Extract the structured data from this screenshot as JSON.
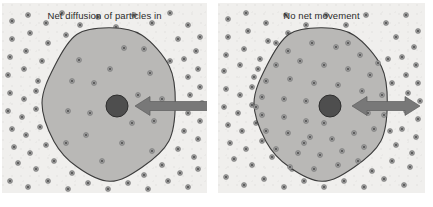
{
  "figure": {
    "kind": "science-diagram",
    "topic": "diffusion across a cell membrane",
    "background_color": "#ffffff",
    "panel_background": "#f0efed"
  },
  "style": {
    "cell_fill": "#b9b8b6",
    "cell_stroke": "#3c3c3c",
    "nucleus_fill": "#4e4e4e",
    "nucleus_stroke": "#2e2e2e",
    "arrow_fill": "#787878",
    "arrow_stroke": "#5d5d5d",
    "particle_fill": "#9a9a9a",
    "particle_core": "#4a4a4a",
    "label_color": "#2b2b2b"
  },
  "panels": [
    {
      "id": "left",
      "label": "Net diffusion of particles in",
      "arrow_icon": "arrow-left-icon",
      "arrow_direction": "inward",
      "arrow_heads": 1,
      "inside_density": "sparse",
      "outside_density": "dense",
      "cell": {
        "cx": 108,
        "cy": 100,
        "rx": 66,
        "ry": 76
      },
      "nucleus": {
        "cx": 115,
        "cy": 103,
        "r": 11
      },
      "arrow": {
        "x1": 208,
        "y1": 103,
        "x2": 133,
        "y2": 103,
        "thickness": 9
      },
      "particles_inside": [
        [
          77,
          57
        ],
        [
          122,
          45
        ],
        [
          148,
          70
        ],
        [
          92,
          80
        ],
        [
          136,
          92
        ],
        [
          66,
          108
        ],
        [
          152,
          118
        ],
        [
          84,
          132
        ],
        [
          120,
          140
        ],
        [
          100,
          158
        ],
        [
          142,
          46
        ],
        [
          70,
          78
        ],
        [
          160,
          96
        ],
        [
          108,
          66
        ],
        [
          130,
          120
        ],
        [
          88,
          110
        ],
        [
          150,
          148
        ],
        [
          64,
          140
        ]
      ],
      "particles_outside": [
        [
          10,
          18
        ],
        [
          26,
          12
        ],
        [
          44,
          20
        ],
        [
          60,
          10
        ],
        [
          78,
          22
        ],
        [
          96,
          14
        ],
        [
          114,
          24
        ],
        [
          132,
          12
        ],
        [
          150,
          20
        ],
        [
          168,
          10
        ],
        [
          186,
          22
        ],
        [
          198,
          34
        ],
        [
          10,
          36
        ],
        [
          28,
          30
        ],
        [
          46,
          40
        ],
        [
          64,
          32
        ],
        [
          176,
          36
        ],
        [
          194,
          48
        ],
        [
          8,
          54
        ],
        [
          24,
          48
        ],
        [
          40,
          58
        ],
        [
          182,
          56
        ],
        [
          196,
          66
        ],
        [
          6,
          72
        ],
        [
          22,
          66
        ],
        [
          36,
          78
        ],
        [
          186,
          74
        ],
        [
          198,
          84
        ],
        [
          8,
          90
        ],
        [
          22,
          96
        ],
        [
          34,
          88
        ],
        [
          188,
          92
        ],
        [
          200,
          100
        ],
        [
          6,
          108
        ],
        [
          20,
          114
        ],
        [
          34,
          106
        ],
        [
          186,
          110
        ],
        [
          198,
          118
        ],
        [
          10,
          126
        ],
        [
          24,
          132
        ],
        [
          38,
          124
        ],
        [
          182,
          128
        ],
        [
          196,
          136
        ],
        [
          12,
          144
        ],
        [
          28,
          150
        ],
        [
          44,
          142
        ],
        [
          176,
          146
        ],
        [
          192,
          154
        ],
        [
          16,
          160
        ],
        [
          34,
          166
        ],
        [
          52,
          158
        ],
        [
          70,
          170
        ],
        [
          88,
          162
        ],
        [
          106,
          172
        ],
        [
          124,
          164
        ],
        [
          142,
          172
        ],
        [
          160,
          162
        ],
        [
          178,
          170
        ],
        [
          196,
          166
        ],
        [
          8,
          178
        ],
        [
          26,
          184
        ],
        [
          46,
          178
        ],
        [
          66,
          186
        ],
        [
          86,
          180
        ],
        [
          106,
          186
        ],
        [
          126,
          180
        ],
        [
          146,
          186
        ],
        [
          166,
          178
        ],
        [
          186,
          184
        ],
        [
          58,
          70
        ],
        [
          168,
          58
        ],
        [
          52,
          122
        ],
        [
          164,
          132
        ],
        [
          50,
          88
        ],
        [
          166,
          82
        ]
      ]
    },
    {
      "id": "right",
      "label": "No net movement",
      "arrow_icon": "arrow-left-right-icon",
      "arrow_direction": "bidirectional",
      "arrow_heads": 2,
      "inside_density": "dense",
      "outside_density": "dense",
      "cell": {
        "cx": 104,
        "cy": 100,
        "rx": 66,
        "ry": 76
      },
      "nucleus": {
        "cx": 112,
        "cy": 103,
        "r": 11
      },
      "arrow": {
        "x1": 134,
        "y1": 103,
        "x2": 202,
        "y2": 103,
        "thickness": 9
      },
      "particles_inside": [
        [
          70,
          48
        ],
        [
          94,
          40
        ],
        [
          118,
          44
        ],
        [
          142,
          52
        ],
        [
          58,
          62
        ],
        [
          82,
          58
        ],
        [
          106,
          62
        ],
        [
          130,
          66
        ],
        [
          152,
          72
        ],
        [
          48,
          78
        ],
        [
          72,
          76
        ],
        [
          96,
          80
        ],
        [
          120,
          82
        ],
        [
          144,
          88
        ],
        [
          164,
          92
        ],
        [
          44,
          94
        ],
        [
          66,
          96
        ],
        [
          88,
          98
        ],
        [
          44,
          112
        ],
        [
          66,
          114
        ],
        [
          88,
          118
        ],
        [
          150,
          110
        ],
        [
          166,
          112
        ],
        [
          48,
          128
        ],
        [
          70,
          130
        ],
        [
          92,
          134
        ],
        [
          114,
          136
        ],
        [
          136,
          130
        ],
        [
          156,
          126
        ],
        [
          58,
          146
        ],
        [
          80,
          150
        ],
        [
          102,
          152
        ],
        [
          124,
          148
        ],
        [
          146,
          144
        ],
        [
          72,
          164
        ],
        [
          96,
          166
        ],
        [
          120,
          162
        ],
        [
          140,
          158
        ],
        [
          106,
          120
        ],
        [
          58,
          40
        ],
        [
          130,
          40
        ],
        [
          160,
          60
        ],
        [
          38,
          104
        ],
        [
          40,
          66
        ],
        [
          86,
          140
        ]
      ],
      "particles_outside": [
        [
          10,
          16
        ],
        [
          28,
          10
        ],
        [
          48,
          20
        ],
        [
          68,
          12
        ],
        [
          88,
          22
        ],
        [
          108,
          12
        ],
        [
          128,
          22
        ],
        [
          148,
          12
        ],
        [
          168,
          20
        ],
        [
          188,
          12
        ],
        [
          200,
          28
        ],
        [
          10,
          34
        ],
        [
          30,
          28
        ],
        [
          50,
          38
        ],
        [
          70,
          30
        ],
        [
          178,
          34
        ],
        [
          196,
          44
        ],
        [
          8,
          52
        ],
        [
          26,
          46
        ],
        [
          42,
          56
        ],
        [
          184,
          54
        ],
        [
          198,
          62
        ],
        [
          6,
          68
        ],
        [
          22,
          62
        ],
        [
          36,
          74
        ],
        [
          188,
          72
        ],
        [
          200,
          80
        ],
        [
          8,
          86
        ],
        [
          22,
          92
        ],
        [
          34,
          84
        ],
        [
          190,
          90
        ],
        [
          202,
          98
        ],
        [
          6,
          104
        ],
        [
          20,
          110
        ],
        [
          34,
          102
        ],
        [
          188,
          108
        ],
        [
          200,
          116
        ],
        [
          10,
          122
        ],
        [
          24,
          128
        ],
        [
          38,
          120
        ],
        [
          184,
          126
        ],
        [
          198,
          134
        ],
        [
          12,
          140
        ],
        [
          28,
          146
        ],
        [
          44,
          138
        ],
        [
          178,
          142
        ],
        [
          194,
          150
        ],
        [
          16,
          156
        ],
        [
          34,
          162
        ],
        [
          54,
          154
        ],
        [
          74,
          166
        ],
        [
          94,
          158
        ],
        [
          114,
          168
        ],
        [
          134,
          160
        ],
        [
          154,
          168
        ],
        [
          174,
          158
        ],
        [
          192,
          164
        ],
        [
          8,
          174
        ],
        [
          26,
          182
        ],
        [
          46,
          176
        ],
        [
          66,
          184
        ],
        [
          86,
          178
        ],
        [
          106,
          184
        ],
        [
          126,
          178
        ],
        [
          146,
          184
        ],
        [
          166,
          176
        ],
        [
          186,
          182
        ],
        [
          56,
          66
        ],
        [
          170,
          56
        ],
        [
          50,
          120
        ],
        [
          172,
          128
        ],
        [
          52,
          86
        ],
        [
          174,
          80
        ]
      ]
    }
  ]
}
